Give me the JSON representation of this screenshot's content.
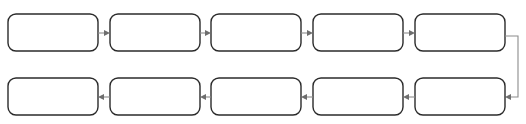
{
  "diagram": {
    "type": "serpentine-flowchart",
    "background_color": "#ffffff",
    "node_border_color": "#2b2b2b",
    "node_fill_color": "#ffffff",
    "connector_color": "#8c8c8c",
    "arrowhead_color": "#6e6e6e",
    "node_corner_radius": 8,
    "node_width": 90,
    "node_height": 37,
    "column_pitch": 101,
    "rows": [
      {
        "id": "row-1",
        "flow_direction": "left-to-right",
        "y_top": 14,
        "nodes": [
          {
            "id": "node-1-1",
            "label": "",
            "x": 8,
            "y": 14
          },
          {
            "id": "node-1-2",
            "label": "",
            "x": 110,
            "y": 14
          },
          {
            "id": "node-1-3",
            "label": "",
            "x": 211,
            "y": 14
          },
          {
            "id": "node-1-4",
            "label": "",
            "x": 313,
            "y": 14
          },
          {
            "id": "node-1-5",
            "label": "",
            "x": 415,
            "y": 14
          }
        ],
        "connectors": [
          {
            "id": "arrow-1-1-to-1-2",
            "from": "node-1-1",
            "to": "node-1-2",
            "direction": "right"
          },
          {
            "id": "arrow-1-2-to-1-3",
            "from": "node-1-2",
            "to": "node-1-3",
            "direction": "right"
          },
          {
            "id": "arrow-1-3-to-1-4",
            "from": "node-1-3",
            "to": "node-1-4",
            "direction": "right"
          },
          {
            "id": "arrow-1-4-to-1-5",
            "from": "node-1-4",
            "to": "node-1-5",
            "direction": "right"
          }
        ]
      },
      {
        "id": "row-2",
        "flow_direction": "right-to-left",
        "y_top": 78,
        "nodes": [
          {
            "id": "node-2-1",
            "label": "",
            "x": 8,
            "y": 78
          },
          {
            "id": "node-2-2",
            "label": "",
            "x": 110,
            "y": 78
          },
          {
            "id": "node-2-3",
            "label": "",
            "x": 211,
            "y": 78
          },
          {
            "id": "node-2-4",
            "label": "",
            "x": 313,
            "y": 78
          },
          {
            "id": "node-2-5",
            "label": "",
            "x": 415,
            "y": 78
          }
        ],
        "connectors": [
          {
            "id": "arrow-2-5-to-2-4",
            "from": "node-2-5",
            "to": "node-2-4",
            "direction": "left"
          },
          {
            "id": "arrow-2-4-to-2-3",
            "from": "node-2-4",
            "to": "node-2-3",
            "direction": "left"
          },
          {
            "id": "arrow-2-3-to-2-2",
            "from": "node-2-3",
            "to": "node-2-2",
            "direction": "left"
          },
          {
            "id": "arrow-2-2-to-2-1",
            "from": "node-2-2",
            "to": "node-2-1",
            "direction": "left"
          }
        ]
      }
    ],
    "wrap_connector": {
      "id": "wrap-row1-to-row2",
      "from": "node-1-5",
      "to": "node-2-5",
      "path_description": "exits right edge of last row-1 node, runs right, turns down, turns left into right edge of last row-2 node",
      "exit_x": 505,
      "exit_y": 36,
      "turn_x": 518,
      "enter_y": 97,
      "enter_x": 505
    }
  }
}
